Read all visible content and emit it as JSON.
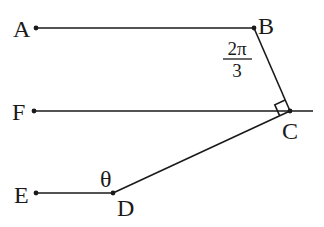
{
  "diagram": {
    "type": "geometry-figure",
    "points": {
      "A": {
        "label": "A",
        "x": 36,
        "y": 28
      },
      "B": {
        "label": "B",
        "x": 254,
        "y": 28
      },
      "C": {
        "label": "C",
        "x": 290,
        "y": 111
      },
      "D": {
        "label": "D",
        "x": 113,
        "y": 193
      },
      "E": {
        "label": "E",
        "x": 36,
        "y": 193
      },
      "F": {
        "label": "F",
        "x": 34,
        "y": 111
      }
    },
    "segments": [
      "AB",
      "BC",
      "FC (extended past C)",
      "CD",
      "ED"
    ],
    "angle_labels": {
      "angle_B": {
        "numerator": "2π",
        "denominator": "3"
      },
      "angle_D": "θ"
    },
    "right_angle_at": "C",
    "right_angle_between": [
      "CB",
      "CD"
    ]
  },
  "labels": {
    "A": "A",
    "B": "B",
    "C": "C",
    "D": "D",
    "E": "E",
    "F": "F",
    "angle_b_num": "2π",
    "angle_b_den": "3",
    "theta": "θ"
  },
  "colors": {
    "ink": "#1a1a1a",
    "background": "#ffffff"
  }
}
